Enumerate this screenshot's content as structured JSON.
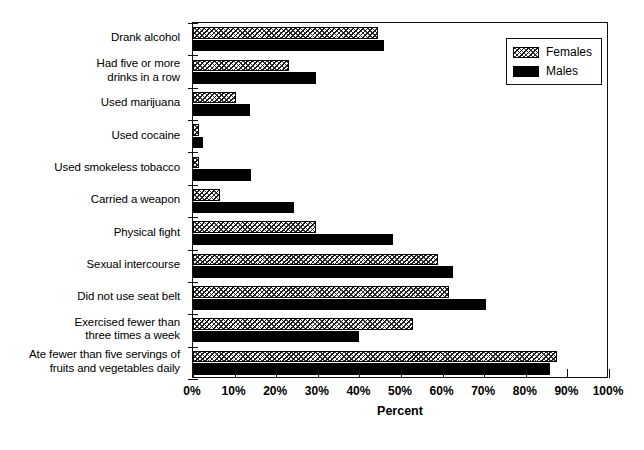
{
  "chart_data": {
    "type": "bar",
    "orientation": "horizontal",
    "title": "",
    "xlabel": "Percent",
    "ylabel": "",
    "xlim": [
      0,
      100
    ],
    "xticks": [
      "0%",
      "10%",
      "20%",
      "30%",
      "40%",
      "50%",
      "60%",
      "70%",
      "80%",
      "90%",
      "100%"
    ],
    "xtick_values": [
      0,
      10,
      20,
      30,
      40,
      50,
      60,
      70,
      80,
      90,
      100
    ],
    "grid": false,
    "legend_position": "top-right",
    "categories": [
      "Drank alcohol",
      "Had five or more\ndrinks in a row",
      "Used marijuana",
      "Used cocaine",
      "Used smokeless tobacco",
      "Carried a weapon",
      "Physical fight",
      "Sexual intercourse",
      "Did not use seat belt",
      "Exercised fewer than\nthree times a week",
      "Ate fewer than five servings of\nfruits and vegetables daily"
    ],
    "series": [
      {
        "name": "Females",
        "style": "hatched",
        "color": "#ffffff",
        "values": [
          44.5,
          23.0,
          10.3,
          1.5,
          1.5,
          6.5,
          29.5,
          59.0,
          61.5,
          53.0,
          87.5
        ]
      },
      {
        "name": "Males",
        "style": "solid",
        "color": "#000000",
        "values": [
          45.8,
          29.5,
          13.8,
          2.3,
          14.0,
          24.3,
          48.0,
          62.5,
          70.5,
          39.8,
          85.8
        ]
      }
    ]
  },
  "legend": {
    "entries": [
      {
        "label": "Females",
        "swatch": "hatched-swatch"
      },
      {
        "label": "Males",
        "swatch": "solid-black-swatch"
      }
    ]
  }
}
